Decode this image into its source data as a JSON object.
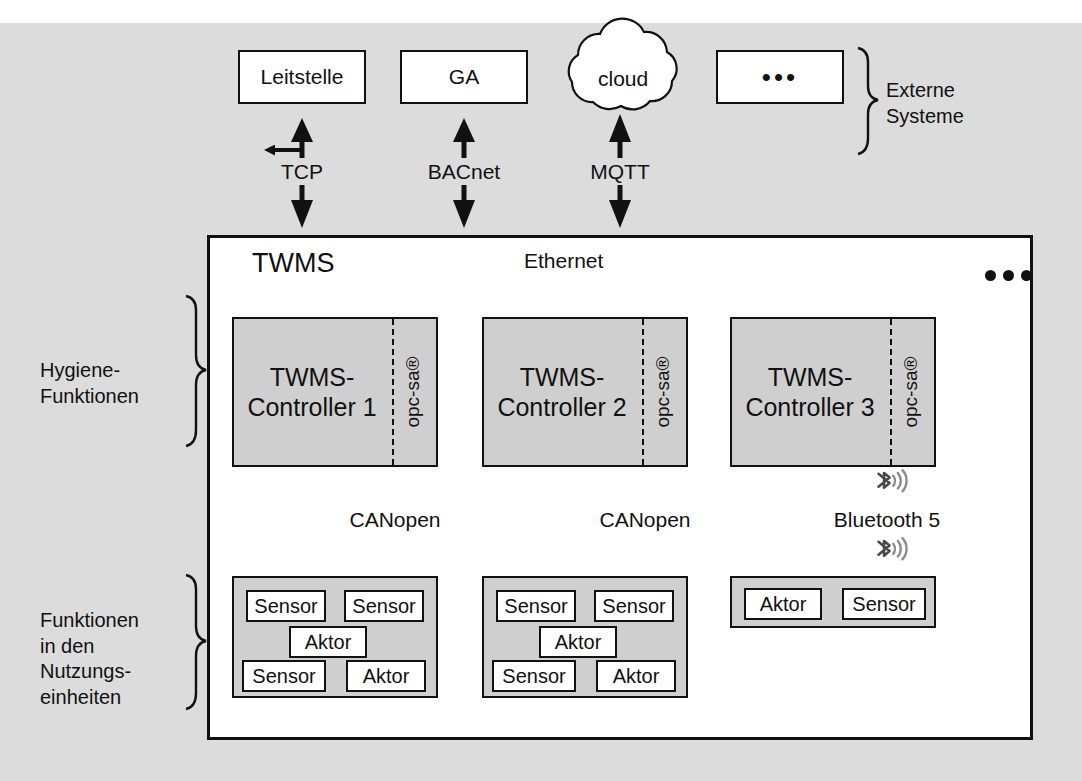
{
  "diagram": {
    "title_twms": "TWMS",
    "bus_label": "Ethernet",
    "bus_more": "•••"
  },
  "external_systems": {
    "group_label": "Externe\nSysteme",
    "nodes": [
      {
        "id": "leitstelle",
        "label": "Leitstelle",
        "shape": "rect",
        "protocol": "TCP"
      },
      {
        "id": "ga",
        "label": "GA",
        "shape": "rect",
        "protocol": "BACnet"
      },
      {
        "id": "cloud",
        "label": "cloud",
        "shape": "cloud",
        "protocol": "MQTT"
      },
      {
        "id": "more",
        "label": "•••",
        "shape": "rect",
        "protocol": ""
      }
    ]
  },
  "hygiene": {
    "group_label": "Hygiene-\nFunktionen",
    "controllers": [
      {
        "id": "c1",
        "label": "TWMS-\nController 1",
        "stack": "opc-sa®",
        "downlink": "CANopen",
        "downlink_type": "wired"
      },
      {
        "id": "c2",
        "label": "TWMS-\nController 2",
        "stack": "opc-sa®",
        "downlink": "CANopen",
        "downlink_type": "wired"
      },
      {
        "id": "c3",
        "label": "TWMS-\nController 3",
        "stack": "opc-sa®",
        "downlink": "Bluetooth 5",
        "downlink_type": "wireless"
      }
    ]
  },
  "nutzungseinheiten": {
    "group_label": "Funktionen\nin den\nNutzungs-\neinheiten",
    "groups": [
      {
        "id": "g1",
        "devices": [
          {
            "label": "Sensor"
          },
          {
            "label": "Sensor"
          },
          {
            "label": "Aktor"
          },
          {
            "label": "Sensor"
          },
          {
            "label": "Aktor"
          }
        ]
      },
      {
        "id": "g2",
        "devices": [
          {
            "label": "Sensor"
          },
          {
            "label": "Sensor"
          },
          {
            "label": "Aktor"
          },
          {
            "label": "Sensor"
          },
          {
            "label": "Aktor"
          }
        ]
      },
      {
        "id": "g3",
        "devices": [
          {
            "label": "Aktor"
          },
          {
            "label": "Sensor"
          }
        ]
      }
    ]
  },
  "colors": {
    "background": "#dcdcdc",
    "panel": "#ffffff",
    "block_fill": "#cfcfcf",
    "stroke": "#111111",
    "bluetooth_icon": "#4a4a4a",
    "bluetooth_waves": "#8c8c8c"
  },
  "icons": {
    "bluetooth": "bluetooth-icon",
    "cloud": "cloud-icon",
    "brace": "curly-brace-icon"
  }
}
